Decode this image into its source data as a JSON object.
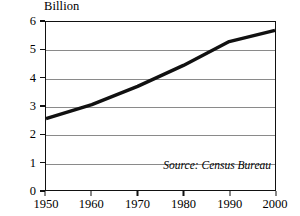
{
  "chart_data": {
    "type": "line",
    "title": "",
    "subtitle": "",
    "xlabel": "",
    "ylabel": "Billion",
    "unit_label": "Billion",
    "x": [
      1950,
      1960,
      1970,
      1980,
      1990,
      2000
    ],
    "values": [
      2.55,
      3.05,
      3.7,
      4.45,
      5.3,
      5.7
    ],
    "series": [
      {
        "name": "World population",
        "values": [
          2.55,
          3.05,
          3.7,
          4.45,
          5.3,
          5.7
        ]
      }
    ],
    "xlim": [
      1950,
      2000
    ],
    "ylim": [
      0,
      6
    ],
    "xticks": [
      1950,
      1960,
      1970,
      1980,
      1990,
      2000
    ],
    "xtick_labels": [
      "1950",
      "1960",
      "1970",
      "1980",
      "1990",
      "2000"
    ],
    "yticks": [
      0,
      1,
      2,
      3,
      4,
      5,
      6
    ],
    "ytick_labels": [
      "0",
      "1",
      "2",
      "3",
      "4",
      "5",
      "6"
    ],
    "grid": "horizontal",
    "legend": "none",
    "annotations": [
      {
        "name": "source-note",
        "text": "Source: Census Bureau",
        "position": "bottom-right-inside"
      }
    ],
    "colors": {
      "line": "#111111",
      "gridline": "#8a8a8a",
      "frame": "#111111",
      "background": "#ffffff",
      "text": "#000000"
    },
    "line_width_px": 3.4
  },
  "source_note": "Source: Census Bureau"
}
